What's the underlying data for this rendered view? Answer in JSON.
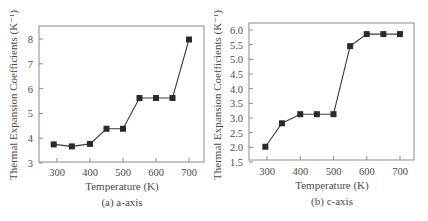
{
  "chart_data": [
    {
      "type": "line",
      "title": "",
      "caption": "(a) a-axis",
      "xlabel": "Temperature (K)",
      "ylabel": "Thermal Expansion Coefficients (K⁻¹)",
      "x": [
        290,
        345,
        400,
        450,
        500,
        550,
        600,
        650,
        700
      ],
      "series": [
        {
          "name": "a-axis",
          "marker": "square",
          "values": [
            3.75,
            3.67,
            3.77,
            4.38,
            4.38,
            5.62,
            5.62,
            5.62,
            7.98
          ]
        }
      ],
      "xlim": [
        250,
        730
      ],
      "ylim": [
        3,
        8.6
      ],
      "xticks": [
        300,
        400,
        500,
        600,
        700
      ],
      "yticks": [
        3,
        4,
        5,
        6,
        7,
        8
      ],
      "ytick_labels": [
        "3",
        "4",
        "5",
        "6",
        "7",
        "8"
      ],
      "grid": false,
      "legend": null
    },
    {
      "type": "line",
      "title": "",
      "caption": "(b) c-axis",
      "xlabel": "Temperature (K)",
      "ylabel": "Thermal Expansion Coefficients (K⁻¹)",
      "x": [
        295,
        345,
        400,
        450,
        500,
        550,
        600,
        650,
        700
      ],
      "series": [
        {
          "name": "c-axis",
          "marker": "square",
          "values": [
            2.02,
            2.82,
            3.13,
            3.13,
            3.13,
            5.45,
            5.86,
            5.86,
            5.86
          ]
        }
      ],
      "xlim": [
        250,
        745
      ],
      "ylim": [
        1.5,
        6.25
      ],
      "xticks": [
        300,
        400,
        500,
        600,
        700
      ],
      "yticks": [
        1.5,
        2.0,
        2.5,
        3.0,
        3.5,
        4.0,
        4.5,
        5.0,
        5.5,
        6.0
      ],
      "ytick_labels": [
        "1.5",
        "2.0",
        "2.5",
        "3.0",
        "3.5",
        "4.0",
        "4.5",
        "5.0",
        "5.5",
        "6.0"
      ],
      "grid": false,
      "legend": null
    }
  ],
  "panels": {
    "a": {
      "caption": "(a) a-axis",
      "xlabel": "Temperature (K)",
      "ylabel": "Thermal Expansion Coefficients (K⁻¹)"
    },
    "b": {
      "caption": "(b) c-axis",
      "xlabel": "Temperature (K)",
      "ylabel": "Thermal Expansion Coefficients (K⁻¹)"
    }
  },
  "colors": {
    "axis": "#8a8a8a",
    "line": "#3a3a3a",
    "marker": "#2a2a2a",
    "text": "#4a4a4a"
  }
}
